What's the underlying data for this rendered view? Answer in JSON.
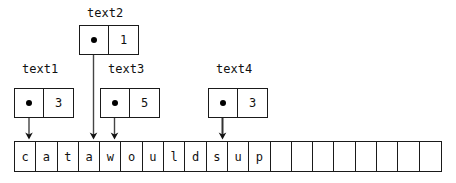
{
  "diagram": {
    "title_text_present": false,
    "colors": {
      "stroke": "#1a1a1a",
      "text": "#111111",
      "dot": "#000000",
      "background": "#ffffff"
    },
    "array": {
      "name": "character-array",
      "total_cells": 20,
      "cells": [
        "c",
        "a",
        "t",
        "a",
        "w",
        "o",
        "u",
        "l",
        "d",
        "s",
        "u",
        "p",
        "",
        "",
        "",
        "",
        "",
        "",
        "",
        ""
      ]
    },
    "nodes": [
      {
        "id": "text1",
        "label": "text1",
        "value": "3",
        "pointer_glyph": "dot",
        "points_to_index": 0,
        "points_to_char": "c"
      },
      {
        "id": "text2",
        "label": "text2",
        "value": "1",
        "pointer_glyph": "dot",
        "points_to_index": 3,
        "points_to_char": "a"
      },
      {
        "id": "text3",
        "label": "text3",
        "value": "5",
        "pointer_glyph": "dot",
        "points_to_index": 4,
        "points_to_char": "w"
      },
      {
        "id": "text4",
        "label": "text4",
        "value": "3",
        "pointer_glyph": "dot",
        "points_to_index": 9,
        "points_to_char": "s"
      }
    ]
  }
}
